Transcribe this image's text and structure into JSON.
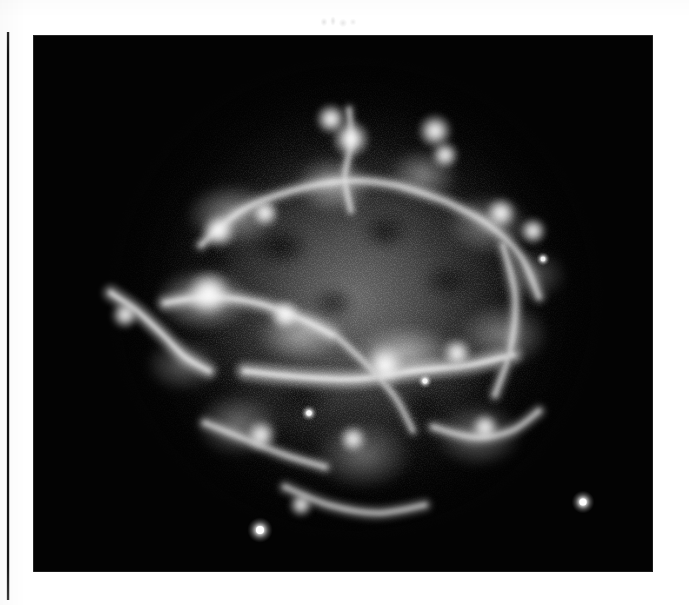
{
  "page": {
    "background_color": "#ffffff",
    "width": 689,
    "height": 605,
    "kind": "scanned-journal-page"
  },
  "margin_rule": {
    "name": "left-margin-rule",
    "color": "#101010",
    "x": 7,
    "y": 32,
    "width": 2,
    "height": 568
  },
  "top_smudge": {
    "name": "scan-artifact-smudge",
    "description": "faint illegible gray smudge above the plate",
    "x": 318,
    "y": 14,
    "width": 44,
    "height": 16
  },
  "figure": {
    "name": "astronomical-image-plate",
    "type": "grayscale-astronomical-image",
    "background_color": "#030303",
    "frame": {
      "x": 33,
      "y": 35,
      "width": 620,
      "height": 537
    },
    "caption": "",
    "title": "",
    "axis_labels": [],
    "tick_labels": [],
    "legend": [],
    "annotations": [],
    "colorbar": null
  },
  "chart_data": {
    "type": "heatmap",
    "title": "",
    "subtitle": "",
    "xlabel": "",
    "ylabel": "",
    "grid": false,
    "legend_position": "none",
    "colormap": "grayscale",
    "value_range": [
      0,
      255
    ],
    "background_value": 3,
    "xlim": [
      0,
      620
    ],
    "ylim": [
      0,
      537
    ],
    "envelope": {
      "center_x": 322,
      "center_y": 263,
      "radius_x": 236,
      "radius_y": 232,
      "peak_value": 205
    },
    "clumps": [
      {
        "x": 200,
        "y": 180,
        "rx": 66,
        "ry": 44,
        "value": 215
      },
      {
        "x": 300,
        "y": 150,
        "rx": 54,
        "ry": 40,
        "value": 225
      },
      {
        "x": 390,
        "y": 140,
        "rx": 48,
        "ry": 36,
        "value": 205
      },
      {
        "x": 455,
        "y": 190,
        "rx": 58,
        "ry": 42,
        "value": 210
      },
      {
        "x": 170,
        "y": 265,
        "rx": 70,
        "ry": 46,
        "value": 230
      },
      {
        "x": 268,
        "y": 300,
        "rx": 62,
        "ry": 38,
        "value": 215
      },
      {
        "x": 372,
        "y": 318,
        "rx": 74,
        "ry": 40,
        "value": 230
      },
      {
        "x": 470,
        "y": 300,
        "rx": 62,
        "ry": 44,
        "value": 205
      },
      {
        "x": 205,
        "y": 390,
        "rx": 58,
        "ry": 44,
        "value": 200
      },
      {
        "x": 330,
        "y": 420,
        "rx": 66,
        "ry": 46,
        "value": 195
      },
      {
        "x": 445,
        "y": 400,
        "rx": 60,
        "ry": 44,
        "value": 200
      },
      {
        "x": 150,
        "y": 330,
        "rx": 50,
        "ry": 36,
        "value": 190
      },
      {
        "x": 500,
        "y": 240,
        "rx": 44,
        "ry": 34,
        "value": 185
      }
    ],
    "voids": [
      {
        "x": 248,
        "y": 212,
        "rx": 40,
        "ry": 28
      },
      {
        "x": 352,
        "y": 196,
        "rx": 34,
        "ry": 26
      },
      {
        "x": 300,
        "y": 268,
        "rx": 30,
        "ry": 22
      },
      {
        "x": 415,
        "y": 246,
        "rx": 36,
        "ry": 24
      },
      {
        "x": 268,
        "y": 362,
        "rx": 42,
        "ry": 30
      },
      {
        "x": 392,
        "y": 372,
        "rx": 34,
        "ry": 26
      },
      {
        "x": 180,
        "y": 224,
        "rx": 30,
        "ry": 24
      },
      {
        "x": 468,
        "y": 352,
        "rx": 34,
        "ry": 24
      }
    ],
    "bright_knots": [
      {
        "name": "knot-top-left",
        "x": 186,
        "y": 196,
        "r": 10,
        "value": 250
      },
      {
        "name": "knot-top-arc-a",
        "x": 232,
        "y": 178,
        "r": 8,
        "value": 246
      },
      {
        "name": "knot-top-center",
        "x": 298,
        "y": 84,
        "r": 9,
        "value": 252
      },
      {
        "name": "knot-top-center-b",
        "x": 318,
        "y": 104,
        "r": 11,
        "value": 255
      },
      {
        "name": "knot-top-right-a",
        "x": 402,
        "y": 96,
        "r": 10,
        "value": 250
      },
      {
        "name": "knot-top-right-b",
        "x": 412,
        "y": 120,
        "r": 8,
        "value": 244
      },
      {
        "name": "knot-upper-right",
        "x": 468,
        "y": 178,
        "r": 9,
        "value": 248
      },
      {
        "name": "knot-right-edge",
        "x": 500,
        "y": 196,
        "r": 8,
        "value": 242
      },
      {
        "name": "knot-mid-left-band",
        "x": 176,
        "y": 258,
        "r": 13,
        "value": 252
      },
      {
        "name": "knot-mid-band-a",
        "x": 252,
        "y": 280,
        "r": 9,
        "value": 244
      },
      {
        "name": "knot-center-filament",
        "x": 352,
        "y": 330,
        "r": 12,
        "value": 255
      },
      {
        "name": "knot-center-right",
        "x": 424,
        "y": 318,
        "r": 9,
        "value": 246
      },
      {
        "name": "knot-left-spur",
        "x": 92,
        "y": 280,
        "r": 8,
        "value": 240
      },
      {
        "name": "knot-lower-left",
        "x": 228,
        "y": 400,
        "r": 9,
        "value": 238
      },
      {
        "name": "knot-lower-center",
        "x": 320,
        "y": 404,
        "r": 8,
        "value": 236
      },
      {
        "name": "knot-lower-right",
        "x": 452,
        "y": 392,
        "r": 8,
        "value": 234
      },
      {
        "name": "knot-bottom-arc",
        "x": 268,
        "y": 470,
        "r": 7,
        "value": 230
      }
    ],
    "filaments": [
      {
        "name": "left-diagonal-spur",
        "points": [
          [
            78,
            258
          ],
          [
            104,
            276
          ],
          [
            130,
            300
          ],
          [
            152,
            322
          ],
          [
            176,
            336
          ]
        ],
        "width": 5,
        "value": 248
      },
      {
        "name": "central-bright-band",
        "points": [
          [
            212,
            336
          ],
          [
            268,
            342
          ],
          [
            324,
            344
          ],
          [
            380,
            336
          ],
          [
            436,
            330
          ],
          [
            480,
            320
          ]
        ],
        "width": 6,
        "value": 252
      },
      {
        "name": "upper-arc",
        "points": [
          [
            168,
            210
          ],
          [
            208,
            176
          ],
          [
            258,
            156
          ],
          [
            312,
            146
          ],
          [
            362,
            150
          ],
          [
            412,
            166
          ]
        ],
        "width": 4,
        "value": 230
      },
      {
        "name": "upper-right-arc",
        "points": [
          [
            412,
            166
          ],
          [
            456,
            190
          ],
          [
            488,
            222
          ],
          [
            506,
            262
          ]
        ],
        "width": 4,
        "value": 226
      },
      {
        "name": "vertical-top-streak",
        "points": [
          [
            316,
            74
          ],
          [
            318,
            108
          ],
          [
            312,
            142
          ],
          [
            318,
            176
          ]
        ],
        "width": 3,
        "value": 236
      },
      {
        "name": "mid-left-band",
        "points": [
          [
            132,
            268
          ],
          [
            176,
            262
          ],
          [
            224,
            268
          ],
          [
            268,
            284
          ],
          [
            300,
            300
          ]
        ],
        "width": 5,
        "value": 240
      },
      {
        "name": "lower-left-arc",
        "points": [
          [
            172,
            388
          ],
          [
            212,
            404
          ],
          [
            252,
            420
          ],
          [
            292,
            432
          ]
        ],
        "width": 4,
        "value": 222
      },
      {
        "name": "lower-right-arc",
        "points": [
          [
            400,
            392
          ],
          [
            440,
            402
          ],
          [
            478,
            396
          ],
          [
            506,
            376
          ]
        ],
        "width": 4,
        "value": 220
      },
      {
        "name": "right-vertical-band",
        "points": [
          [
            470,
            210
          ],
          [
            482,
            260
          ],
          [
            478,
            312
          ],
          [
            462,
            360
          ]
        ],
        "width": 4,
        "value": 224
      },
      {
        "name": "bottom-center-arc",
        "points": [
          [
            252,
            452
          ],
          [
            296,
            470
          ],
          [
            344,
            478
          ],
          [
            392,
            470
          ]
        ],
        "width": 4,
        "value": 212
      },
      {
        "name": "center-cross-band",
        "points": [
          [
            302,
            300
          ],
          [
            334,
            330
          ],
          [
            362,
            362
          ],
          [
            380,
            396
          ]
        ],
        "width": 3,
        "value": 222
      }
    ],
    "point_sources": [
      {
        "name": "point-source-bottom-left",
        "x": 227,
        "y": 495,
        "r": 4.0,
        "value": 255
      },
      {
        "name": "point-source-bottom-right",
        "x": 550,
        "y": 467,
        "r": 3.6,
        "value": 252
      },
      {
        "name": "point-source-mid-left",
        "x": 276,
        "y": 378,
        "r": 2.6,
        "value": 244
      },
      {
        "name": "point-source-inner",
        "x": 392,
        "y": 346,
        "r": 2.4,
        "value": 240
      },
      {
        "name": "point-source-right",
        "x": 510,
        "y": 224,
        "r": 2.2,
        "value": 236
      }
    ]
  }
}
